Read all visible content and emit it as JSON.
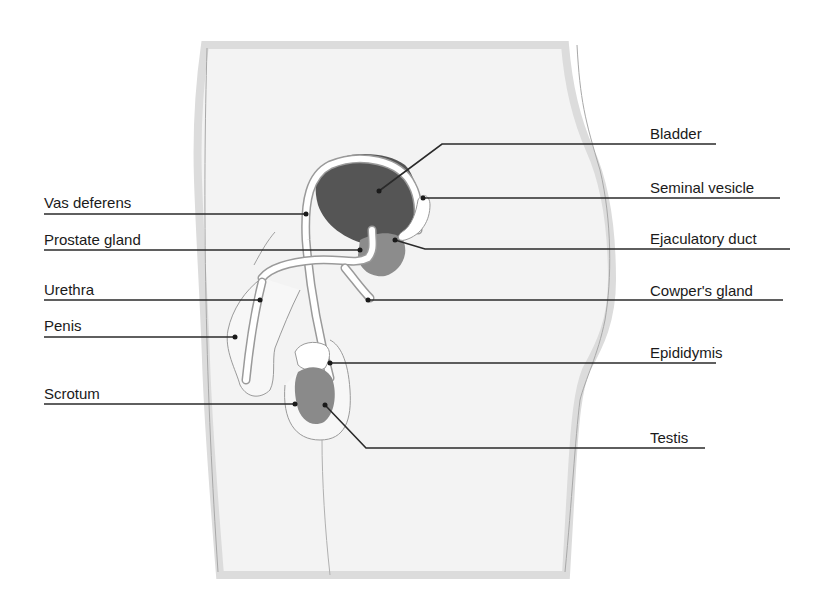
{
  "diagram": {
    "type": "anatomical-labelled-diagram",
    "colors": {
      "body_fill": "#f3f3f3",
      "body_edge": "#d8d8d8",
      "outline": "#9a9a9a",
      "bladder": "#5a5a5a",
      "prostate": "#8c8c8c",
      "testis": "#8a8a8a",
      "duct_fill": "#ffffff",
      "leader_line": "#2a2a2a",
      "label_text": "#1a1a1a"
    },
    "labels_left": [
      {
        "text": "Vas deferens",
        "x": 44,
        "y": 195
      },
      {
        "text": "Prostate gland",
        "x": 44,
        "y": 232
      },
      {
        "text": "Urethra",
        "x": 44,
        "y": 282
      },
      {
        "text": "Penis",
        "x": 44,
        "y": 318
      },
      {
        "text": "Scrotum",
        "x": 44,
        "y": 386
      }
    ],
    "labels_right": [
      {
        "text": "Bladder",
        "x": 650,
        "y": 128
      },
      {
        "text": "Seminal vesicle",
        "x": 650,
        "y": 180
      },
      {
        "text": "Ejaculatory duct",
        "x": 650,
        "y": 232
      },
      {
        "text": "Cowper's gland",
        "x": 650,
        "y": 285
      },
      {
        "text": "Epididymis",
        "x": 650,
        "y": 345
      },
      {
        "text": "Testis",
        "x": 650,
        "y": 430
      }
    ]
  }
}
